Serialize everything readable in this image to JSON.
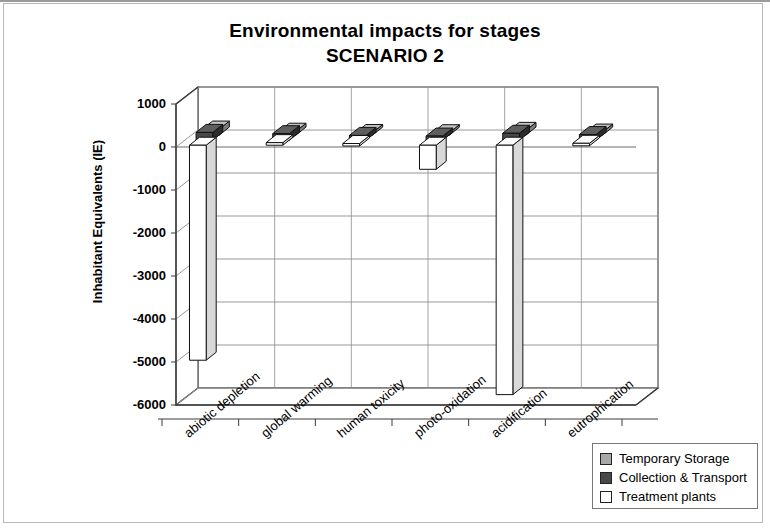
{
  "chart_data": {
    "type": "bar",
    "title": "Environmental impacts for stages",
    "subtitle": "SCENARIO 2",
    "title_line1": "Environmental impacts for stages",
    "title_line2": "SCENARIO 2",
    "xlabel": "",
    "ylabel": "Inhabitant Equivalents (IE)",
    "ylim": [
      -6000,
      1000
    ],
    "ytick_labels": [
      "1000",
      "0",
      "-1000",
      "-2000",
      "-3000",
      "-4000",
      "-5000",
      "-6000"
    ],
    "ytick_values": [
      1000,
      0,
      -1000,
      -2000,
      -3000,
      -4000,
      -5000,
      -6000
    ],
    "grid": true,
    "legend_position": "bottom-right",
    "three_d": true,
    "categories": [
      "abiotic depletion",
      "global warming",
      "human toxicity",
      "photo-oxidation",
      "acidification",
      "eutrophication"
    ],
    "series": [
      {
        "name": "Temporary Storage",
        "color": "#a8a8a8",
        "values": [
          140,
          90,
          60,
          55,
          110,
          70
        ]
      },
      {
        "name": "Collection & Transport",
        "color": "#484848",
        "values": [
          180,
          150,
          110,
          95,
          160,
          130
        ]
      },
      {
        "name": "Treatment plants",
        "color": "#ffffff",
        "values": [
          -5000,
          60,
          40,
          -560,
          -5800,
          45
        ]
      }
    ]
  },
  "legend": {
    "items": [
      {
        "label": "Temporary Storage",
        "color": "#a8a8a8"
      },
      {
        "label": "Collection & Transport",
        "color": "#484848"
      },
      {
        "label": "Treatment plants",
        "color": "#ffffff"
      }
    ]
  }
}
